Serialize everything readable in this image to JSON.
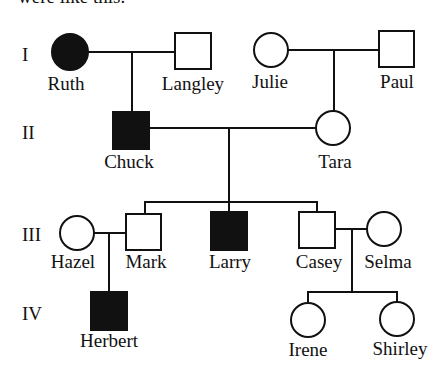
{
  "header": {
    "clipped_text": "were like this:"
  },
  "diagram": {
    "type": "pedigree",
    "colors": {
      "stroke": "#111111",
      "affected": "#111111",
      "unaffected": "#ffffff"
    },
    "generations": [
      {
        "label": "I",
        "x": 22,
        "y": 61
      },
      {
        "label": "II",
        "x": 22,
        "y": 139
      },
      {
        "label": "III",
        "x": 22,
        "y": 241
      },
      {
        "label": "IV",
        "x": 22,
        "y": 319
      }
    ],
    "individuals": [
      {
        "id": "ruth",
        "name": "Ruth",
        "sex": "female",
        "affected": true,
        "generation": "I",
        "cx": 70,
        "cy": 52,
        "label_x": 66,
        "label_y": 90
      },
      {
        "id": "langley",
        "name": "Langley",
        "sex": "male",
        "affected": false,
        "generation": "I",
        "cx": 193,
        "cy": 51,
        "label_x": 193,
        "label_y": 90
      },
      {
        "id": "julie",
        "name": "Julie",
        "sex": "female",
        "affected": false,
        "generation": "I",
        "cx": 271,
        "cy": 50,
        "label_x": 270,
        "label_y": 88
      },
      {
        "id": "paul",
        "name": "Paul",
        "sex": "male",
        "affected": false,
        "generation": "I",
        "cx": 397,
        "cy": 49,
        "label_x": 397,
        "label_y": 88
      },
      {
        "id": "chuck",
        "name": "Chuck",
        "sex": "male",
        "affected": true,
        "generation": "II",
        "cx": 131,
        "cy": 130,
        "label_x": 129,
        "label_y": 168
      },
      {
        "id": "tara",
        "name": "Tara",
        "sex": "female",
        "affected": false,
        "generation": "II",
        "cx": 333,
        "cy": 128,
        "label_x": 335,
        "label_y": 168
      },
      {
        "id": "hazel",
        "name": "Hazel",
        "sex": "female",
        "affected": false,
        "generation": "III",
        "cx": 77,
        "cy": 233,
        "label_x": 73,
        "label_y": 268
      },
      {
        "id": "mark",
        "name": "Mark",
        "sex": "male",
        "affected": false,
        "generation": "III",
        "cx": 144,
        "cy": 232,
        "label_x": 146,
        "label_y": 268
      },
      {
        "id": "larry",
        "name": "Larry",
        "sex": "male",
        "affected": true,
        "generation": "III",
        "cx": 229,
        "cy": 231,
        "label_x": 230,
        "label_y": 268
      },
      {
        "id": "casey",
        "name": "Casey",
        "sex": "male",
        "affected": false,
        "generation": "III",
        "cx": 317,
        "cy": 230,
        "label_x": 319,
        "label_y": 268
      },
      {
        "id": "selma",
        "name": "Selma",
        "sex": "female",
        "affected": false,
        "generation": "III",
        "cx": 384,
        "cy": 229,
        "label_x": 388,
        "label_y": 268
      },
      {
        "id": "herbert",
        "name": "Herbert",
        "sex": "male",
        "affected": true,
        "generation": "IV",
        "cx": 109,
        "cy": 311,
        "label_x": 109,
        "label_y": 347
      },
      {
        "id": "irene",
        "name": "Irene",
        "sex": "female",
        "affected": false,
        "generation": "IV",
        "cx": 308,
        "cy": 320,
        "label_x": 308,
        "label_y": 350
      },
      {
        "id": "shirley",
        "name": "Shirley",
        "sex": "female",
        "affected": false,
        "generation": "IV",
        "cx": 397,
        "cy": 319,
        "label_x": 400,
        "label_y": 349
      }
    ],
    "matings": [
      {
        "a": "ruth",
        "b": "langley"
      },
      {
        "a": "julie",
        "b": "paul"
      },
      {
        "a": "chuck",
        "b": "tara"
      },
      {
        "a": "hazel",
        "b": "mark"
      },
      {
        "a": "casey",
        "b": "selma"
      }
    ],
    "offspring": [
      {
        "parents": "ruth+langley",
        "children": [
          "chuck"
        ]
      },
      {
        "parents": "julie+paul",
        "children": [
          "tara"
        ]
      },
      {
        "parents": "chuck+tara",
        "children": [
          "mark",
          "larry",
          "casey"
        ]
      },
      {
        "parents": "hazel+mark",
        "children": [
          "herbert"
        ]
      },
      {
        "parents": "casey+selma",
        "children": [
          "irene",
          "shirley"
        ]
      }
    ]
  }
}
